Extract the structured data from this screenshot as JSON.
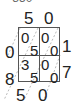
{
  "header_partial": "= 850",
  "multiplicand_digits": [
    "5",
    "0"
  ],
  "multiplier_digits": [
    "1",
    "7"
  ],
  "cells": [
    [
      {
        "tens": "0",
        "ones": "5"
      },
      {
        "tens": "0",
        "ones": "0"
      }
    ],
    [
      {
        "tens": "3",
        "ones": "5"
      },
      {
        "tens": "0",
        "ones": "0"
      }
    ]
  ],
  "left_sums": [
    "0",
    "8"
  ],
  "bottom_sums": [
    "5",
    "0"
  ]
}
